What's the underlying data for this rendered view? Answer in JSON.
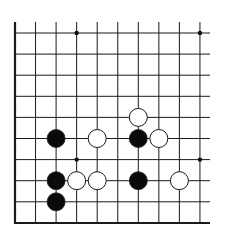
{
  "board": {
    "description": "Go board diagram, corner section (bottom-left), open on top and right",
    "columns": 10,
    "rows": 10,
    "origin_x": 15,
    "origin_y": 33,
    "spacing_x": 20.55,
    "spacing_y": 21.1,
    "line_top_y": 22,
    "right_end_x": 210,
    "bottom_edge_y": 223,
    "line_color": "#1a1a1a",
    "stone_radius": 9,
    "star_points": [
      {
        "col": 3,
        "row": 0
      },
      {
        "col": 9,
        "row": 0
      },
      {
        "col": 3,
        "row": 6
      },
      {
        "col": 9,
        "row": 6
      }
    ],
    "stones": [
      {
        "color": "white",
        "col": 6,
        "row": 4
      },
      {
        "color": "black",
        "col": 2,
        "row": 5
      },
      {
        "color": "white",
        "col": 4,
        "row": 5
      },
      {
        "color": "black",
        "col": 6,
        "row": 5
      },
      {
        "color": "white",
        "col": 7,
        "row": 5
      },
      {
        "color": "black",
        "col": 2,
        "row": 7
      },
      {
        "color": "white",
        "col": 3,
        "row": 7
      },
      {
        "color": "white",
        "col": 4,
        "row": 7
      },
      {
        "color": "black",
        "col": 6,
        "row": 7
      },
      {
        "color": "white",
        "col": 8,
        "row": 7
      },
      {
        "color": "black",
        "col": 2,
        "row": 8
      }
    ]
  }
}
